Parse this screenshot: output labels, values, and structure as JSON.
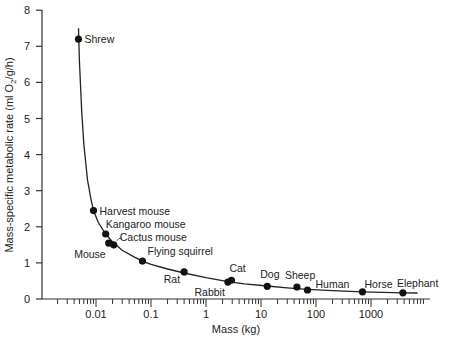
{
  "chart_data": {
    "type": "scatter",
    "title": "",
    "xlabel": "Mass (kg)",
    "ylabel": "Mass-specific metabolic rate (ml O2/g/h)",
    "xscale": "log",
    "xlim": [
      0.001,
      10000
    ],
    "ylim": [
      0,
      8
    ],
    "x_ticks": [
      "0.01",
      "0.1",
      "1",
      "10",
      "100",
      "1000"
    ],
    "y_ticks": [
      "0",
      "1",
      "2",
      "3",
      "4",
      "5",
      "6",
      "7",
      "8"
    ],
    "grid": false,
    "legend": null,
    "series": [
      {
        "name": "Mammals",
        "points": [
          {
            "label": "Shrew",
            "x": 0.0048,
            "y": 7.2
          },
          {
            "label": "Harvest mouse",
            "x": 0.009,
            "y": 2.45
          },
          {
            "label": "Kangaroo mouse",
            "x": 0.015,
            "y": 1.8
          },
          {
            "label": "Mouse",
            "x": 0.017,
            "y": 1.55
          },
          {
            "label": "Cactus mouse",
            "x": 0.021,
            "y": 1.5
          },
          {
            "label": "Flying squirrel",
            "x": 0.07,
            "y": 1.05
          },
          {
            "label": "Rat",
            "x": 0.4,
            "y": 0.75
          },
          {
            "label": "Rabbit",
            "x": 2.5,
            "y": 0.47
          },
          {
            "label": "Cat",
            "x": 2.9,
            "y": 0.52
          },
          {
            "label": "Dog",
            "x": 13,
            "y": 0.35
          },
          {
            "label": "Sheep",
            "x": 45,
            "y": 0.33
          },
          {
            "label": "Human",
            "x": 70,
            "y": 0.25
          },
          {
            "label": "Horse",
            "x": 700,
            "y": 0.2
          },
          {
            "label": "Elephant",
            "x": 3800,
            "y": 0.17
          }
        ]
      }
    ],
    "fit_curve": "power-law decline"
  }
}
